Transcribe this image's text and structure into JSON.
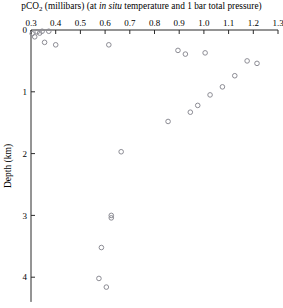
{
  "chart_data": {
    "type": "scatter",
    "title": "pCO2 (millibars) (at in situ temperature and 1 bar total pressure)",
    "title_parts": {
      "lead": "pCO",
      "subscript": "2",
      "mid": " (millibars) (at ",
      "italic": "in situ",
      "tail": " temperature and 1 bar total pressure)"
    },
    "xlabel": "",
    "ylabel": "Depth (km)",
    "xlim": [
      0.3,
      1.3
    ],
    "ylim": [
      0,
      4.4
    ],
    "y_inverted": true,
    "x_axis_position": "top",
    "grid": false,
    "legend": null,
    "marker": "open-circle",
    "marker_color": "#8c8c94",
    "xticks": [
      0.3,
      0.4,
      0.5,
      0.6,
      0.7,
      0.8,
      0.9,
      1.0,
      1.1,
      1.2,
      1.3
    ],
    "xtick_labels": [
      "0.3",
      "0.4",
      "0.5",
      "0.6",
      "0.7",
      "0.8",
      "0.9",
      "1.0",
      "1.1",
      "1.2",
      "1.3"
    ],
    "yticks": [
      0,
      1,
      2,
      3,
      4
    ],
    "ytick_labels": [
      "0",
      "1",
      "2",
      "3",
      "4"
    ],
    "points": [
      {
        "x": 0.305,
        "y": 0.06
      },
      {
        "x": 0.315,
        "y": 0.11
      },
      {
        "x": 0.325,
        "y": 0.03
      },
      {
        "x": 0.335,
        "y": 0.05
      },
      {
        "x": 0.345,
        "y": 0.02
      },
      {
        "x": 0.355,
        "y": 0.2
      },
      {
        "x": 0.372,
        "y": 0.02
      },
      {
        "x": 0.4,
        "y": 0.24
      },
      {
        "x": 0.615,
        "y": 0.24
      },
      {
        "x": 0.895,
        "y": 0.33
      },
      {
        "x": 0.925,
        "y": 0.39
      },
      {
        "x": 1.005,
        "y": 0.37
      },
      {
        "x": 1.175,
        "y": 0.5
      },
      {
        "x": 1.215,
        "y": 0.54
      },
      {
        "x": 1.125,
        "y": 0.74
      },
      {
        "x": 1.075,
        "y": 0.92
      },
      {
        "x": 1.025,
        "y": 1.05
      },
      {
        "x": 0.975,
        "y": 1.22
      },
      {
        "x": 0.945,
        "y": 1.33
      },
      {
        "x": 0.855,
        "y": 1.48
      },
      {
        "x": 0.665,
        "y": 1.97
      },
      {
        "x": 0.625,
        "y": 3.0
      },
      {
        "x": 0.625,
        "y": 3.04
      },
      {
        "x": 0.585,
        "y": 3.52
      },
      {
        "x": 0.575,
        "y": 4.02
      },
      {
        "x": 0.605,
        "y": 4.16
      }
    ]
  }
}
